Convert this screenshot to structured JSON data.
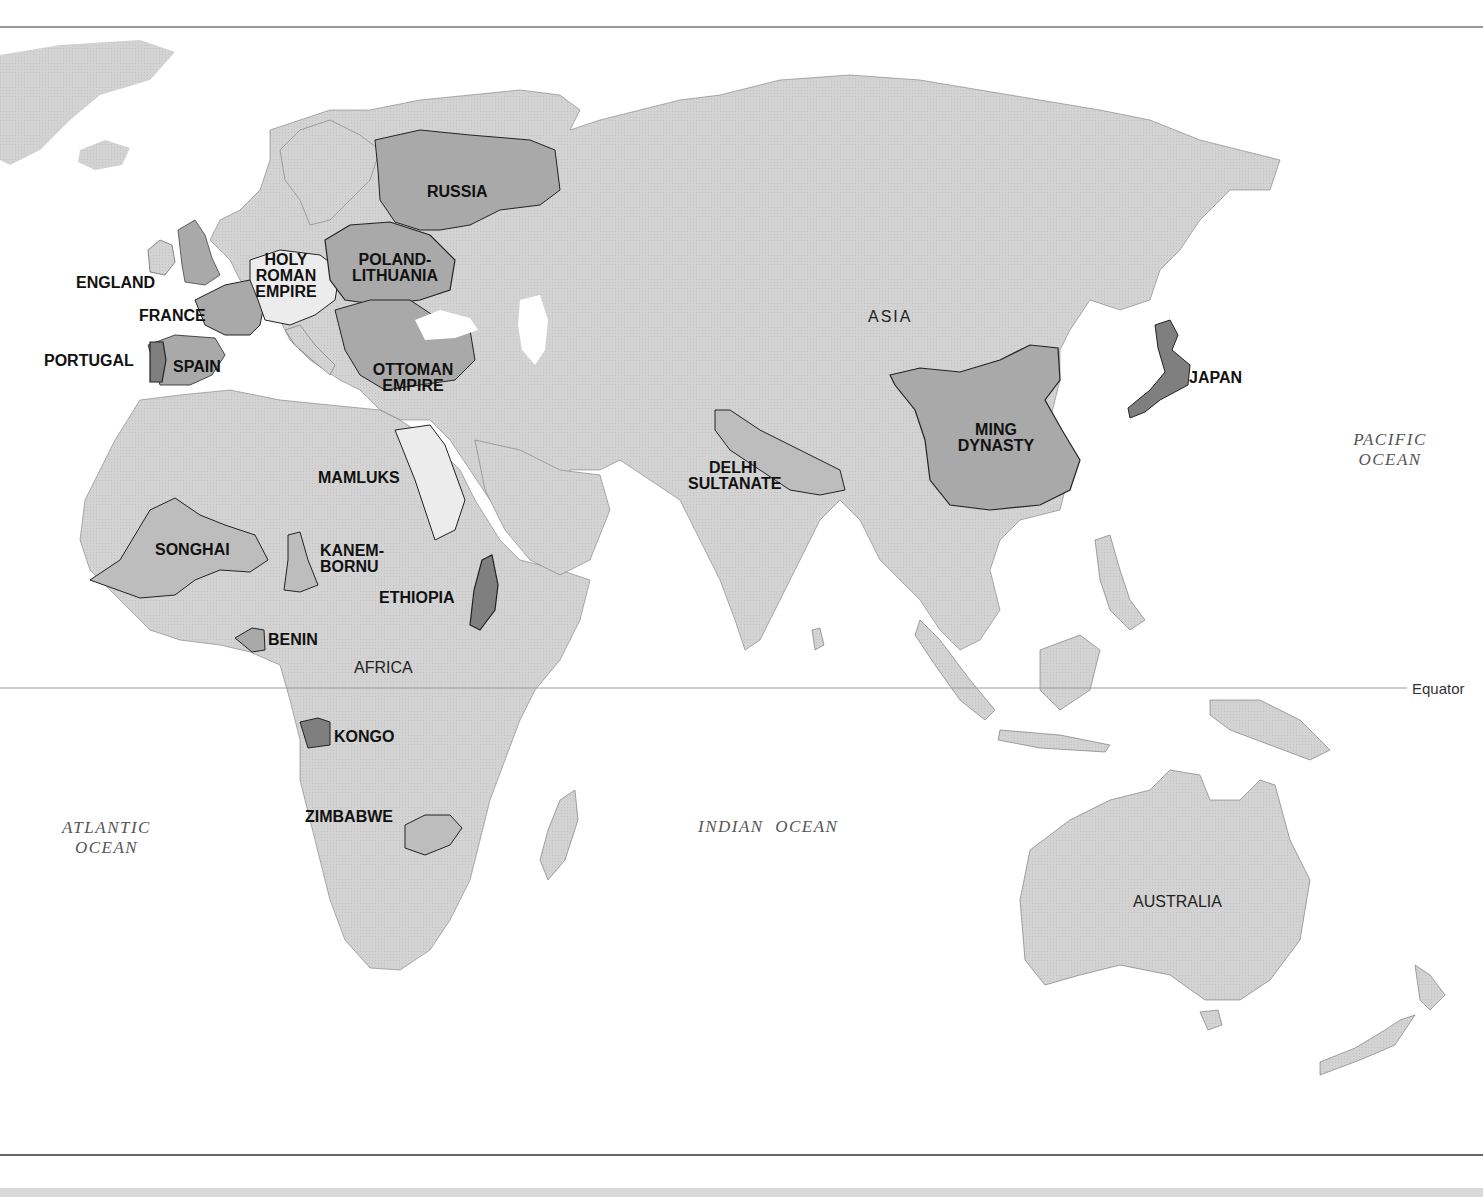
{
  "colors": {
    "land": "#d3d3d3",
    "state_medium": "#a9a9a9",
    "state_dark": "#7f7f7f",
    "state_light": "#ececec",
    "water": "#ffffff",
    "border": "#222222",
    "bottom_bar": "#d9d9d9"
  },
  "continents": {
    "asia": "ASIA",
    "africa": "AFRICA",
    "australia": "AUSTRALIA"
  },
  "oceans": {
    "atlantic": [
      "ATLANTIC",
      "OCEAN"
    ],
    "indian": "INDIAN  OCEAN",
    "pacific": [
      "PACIFIC",
      "OCEAN"
    ]
  },
  "equator_label": "Equator",
  "states": {
    "russia": [
      "RUSSIA"
    ],
    "england": [
      "ENGLAND"
    ],
    "france": [
      "FRANCE"
    ],
    "holy_roman_empire": [
      "HOLY",
      "ROMAN",
      "EMPIRE"
    ],
    "poland_lithuania": [
      "POLAND-",
      "LITHUANIA"
    ],
    "portugal": [
      "PORTUGAL"
    ],
    "spain": [
      "SPAIN"
    ],
    "ottoman_empire": [
      "OTTOMAN",
      "EMPIRE"
    ],
    "mamluks": [
      "MAMLUKS"
    ],
    "songhai": [
      "SONGHAI"
    ],
    "kanem_bornu": [
      "KANEM-",
      "BORNU"
    ],
    "ethiopia": [
      "ETHIOPIA"
    ],
    "benin": [
      "BENIN"
    ],
    "kongo": [
      "KONGO"
    ],
    "zimbabwe": [
      "ZIMBABWE"
    ],
    "delhi_sultanate": [
      "DELHI",
      "SULTANATE"
    ],
    "ming_dynasty": [
      "MING",
      "DYNASTY"
    ],
    "japan": [
      "JAPAN"
    ]
  }
}
